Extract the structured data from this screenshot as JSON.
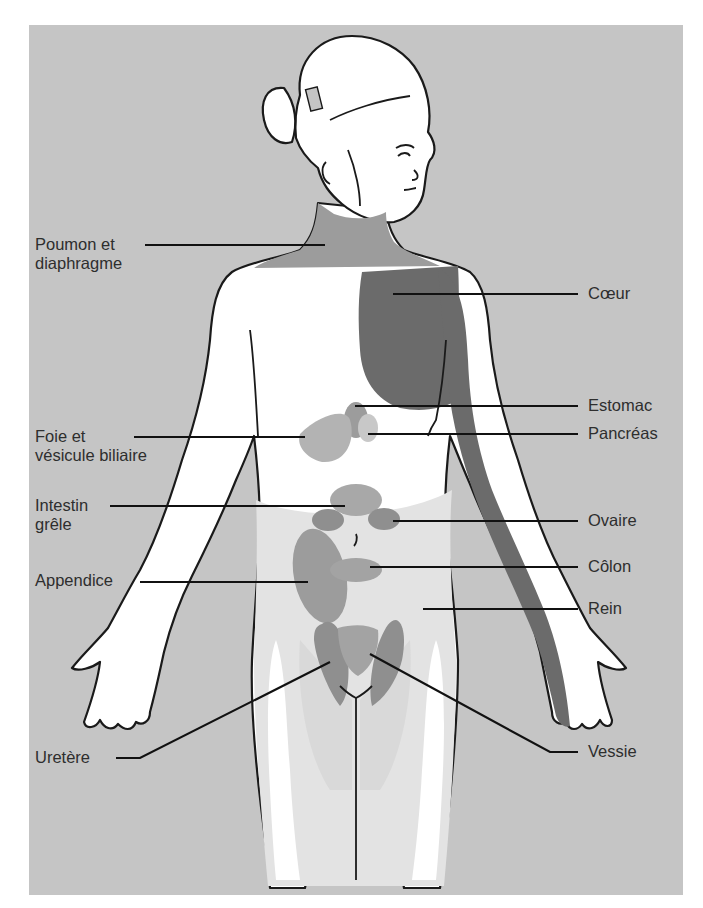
{
  "figure": {
    "colors": {
      "background": "#c5c5c5",
      "skin": "#ffffff",
      "light_zone": "#e3e3e3",
      "medium_zone": "#9c9c9c",
      "dark_zone": "#6b6b6b",
      "outline": "#1a1a1a",
      "text": "#2e2e2e"
    }
  },
  "labels": {
    "left": [
      {
        "id": "poumon",
        "text": "Poumon et\ndiaphragme"
      },
      {
        "id": "foie",
        "text": "Foie et\nvésicule biliaire"
      },
      {
        "id": "intestin",
        "text": "Intestin\ngrêle"
      },
      {
        "id": "appendice",
        "text": "Appendice"
      },
      {
        "id": "uretere",
        "text": "Uretère"
      }
    ],
    "right": [
      {
        "id": "coeur",
        "text": "Cœur"
      },
      {
        "id": "estomac",
        "text": "Estomac"
      },
      {
        "id": "pancreas",
        "text": "Pancréas"
      },
      {
        "id": "ovaire",
        "text": "Ovaire"
      },
      {
        "id": "colon",
        "text": "Côlon"
      },
      {
        "id": "rein",
        "text": "Rein"
      },
      {
        "id": "vessie",
        "text": "Vessie"
      }
    ]
  }
}
